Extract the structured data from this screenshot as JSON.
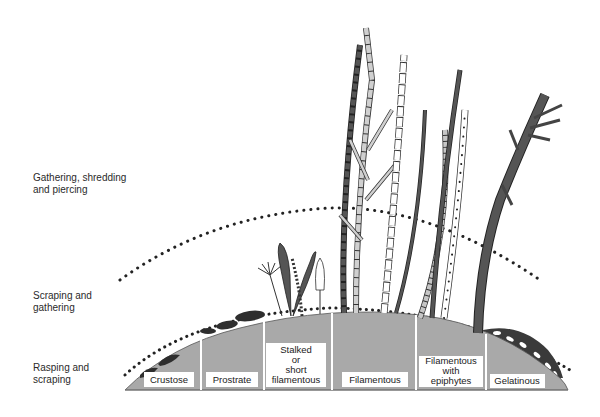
{
  "zones": [
    {
      "id": "upper",
      "label": "Gathering, shredding\nand piercing"
    },
    {
      "id": "middle",
      "label": "Scraping and\ngathering"
    },
    {
      "id": "lower",
      "label": "Rasping and\nscraping"
    }
  ],
  "growth_forms": [
    {
      "label_lines": [
        "Crustose"
      ]
    },
    {
      "label_lines": [
        "Prostrate"
      ]
    },
    {
      "label_lines": [
        "Stalked",
        "or",
        "short",
        "filamentous"
      ]
    },
    {
      "label_lines": [
        "Filamentous"
      ]
    },
    {
      "label_lines": [
        "Filamentous",
        "with",
        "epiphytes"
      ]
    },
    {
      "label_lines": [
        "Gelatinous"
      ]
    }
  ],
  "colors": {
    "substrate": "#a9a9a9",
    "dark_alga": "#4a4a4a",
    "light_alga": "#c4c4c4",
    "outline": "#222222",
    "dots": "#222222"
  }
}
